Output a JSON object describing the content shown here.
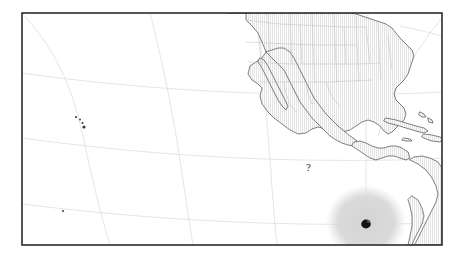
{
  "figure": {
    "type": "map",
    "background_color": "#ffffff",
    "frame": {
      "x": 22,
      "y": 13,
      "width": 420,
      "height": 232,
      "border_color": "#2b2b2b",
      "border_width": 1.6,
      "fill_color": "#ffffff"
    },
    "projection_hint": "curved graticule / conic projection",
    "region_label": "Eastern Pacific Ocean and North America"
  },
  "graticule": {
    "color": "#dcdcdc",
    "width": 0.8,
    "meridians": [
      "left-upper-diagonal",
      "mid-vertical-curve",
      "right-upper-diagonal",
      "blob-center-vertical"
    ],
    "parallels": [
      "upper-parallel",
      "mid-parallel",
      "lower-parallel"
    ]
  },
  "land": {
    "outline_color": "#4a4a4a",
    "outline_width": 0.7,
    "fill_color": "#fcfcfc",
    "hatch_color": "#d2d2d2",
    "hatch_pattern": "fine-vertical-lines",
    "border_color": "#b8b8b8",
    "features": [
      "United States with state boundaries",
      "Canada southern edge and Great Lakes",
      "Mexico and Baja California",
      "Central America",
      "Cuba",
      "Hispaniola",
      "Puerto Rico",
      "Jamaica",
      "Bahamas",
      "Lesser Antilles",
      "Northern South America",
      "Hawaiian Islands"
    ]
  },
  "uncertainty_region": {
    "name": "search-area-blob",
    "fill_color": "#d6d6d6",
    "opacity": 0.85,
    "center_x": 366,
    "center_y": 222,
    "radius_x": 40,
    "radius_y": 36,
    "blur": 3
  },
  "marker": {
    "name": "location-marker",
    "color": "#141414",
    "x": 366,
    "y": 224,
    "radius": 4.6
  },
  "small_islands": [
    {
      "name": "hawaii-kauai",
      "x": 76,
      "y": 117,
      "r": 1.1
    },
    {
      "name": "hawaii-oahu",
      "x": 80,
      "y": 119,
      "r": 0.9
    },
    {
      "name": "hawaii-maui",
      "x": 83,
      "y": 123,
      "r": 1.0
    },
    {
      "name": "hawaii-bigisland",
      "x": 84,
      "y": 127,
      "r": 1.5
    },
    {
      "name": "clipperton-island",
      "x": 63,
      "y": 211,
      "r": 1.0
    }
  ],
  "annotations": [
    {
      "name": "question-mark-annotation",
      "text": "?",
      "x": 307,
      "y": 162,
      "font_size": 11,
      "color": "#2a2a2a"
    }
  ]
}
